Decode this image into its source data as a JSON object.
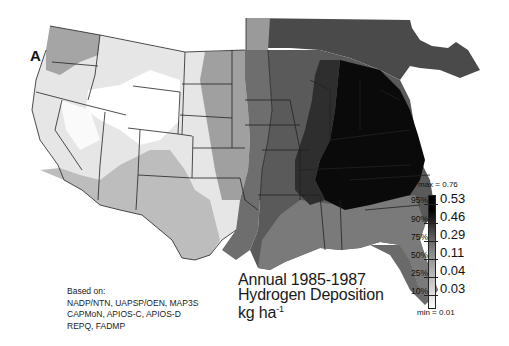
{
  "figure": {
    "panel_label": "A",
    "title_lines": [
      "Annual 1985-1987",
      "Hydrogen Deposition"
    ],
    "units_base": "kg ha",
    "units_exponent": "-1",
    "sources": {
      "heading": "Based on:",
      "lines": [
        "NADP/NTN, UAPSP/OEN, MAP3S",
        "CAPMoN, APIOS-C, APIOS-D",
        "REPQ, FADMP"
      ]
    }
  },
  "legend": {
    "max_label": "max = 0.76",
    "min_label": "min = 0.01",
    "classes": [
      {
        "percentile": "95%",
        "value": "0.53"
      },
      {
        "percentile": "90%",
        "value": "0.46"
      },
      {
        "percentile": "75%",
        "value": "0.29"
      },
      {
        "percentile": "50%",
        "value": "0.11"
      },
      {
        "percentile": "25%",
        "value": "0.04"
      },
      {
        "percentile": "10%",
        "value": "0.03"
      }
    ]
  },
  "colors": {
    "very_high": "#0a0a0a",
    "high": "#3a3a3a",
    "mid_high": "#5e5e5e",
    "mid": "#8a8a8a",
    "low": "#b8b8b8",
    "very_low": "#dcdcdc",
    "minimum": "#ffffff",
    "border": "#222222"
  }
}
